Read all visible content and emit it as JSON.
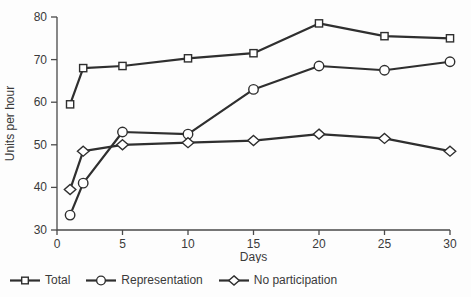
{
  "figure": {
    "background": "#fdfdfd"
  },
  "chart_data": {
    "type": "line",
    "title": "",
    "xlabel": "Days",
    "ylabel": "Units per hour",
    "xlim": [
      0,
      30
    ],
    "ylim": [
      30,
      80
    ],
    "x_ticks": [
      0,
      5,
      10,
      15,
      20,
      25,
      30
    ],
    "y_ticks": [
      30,
      40,
      50,
      60,
      70,
      80
    ],
    "grid": false,
    "legend_position": "bottom-left",
    "x": [
      1,
      2,
      5,
      10,
      15,
      20,
      25,
      30
    ],
    "series": [
      {
        "name": "Total",
        "marker": "square",
        "values": [
          59.5,
          68,
          68.5,
          70.3,
          71.5,
          78.5,
          75.5,
          75
        ]
      },
      {
        "name": "Representation",
        "marker": "circle",
        "values": [
          33.5,
          41,
          53,
          52.5,
          63,
          68.5,
          67.5,
          69.5
        ]
      },
      {
        "name": "No participation",
        "marker": "diamond",
        "values": [
          39.5,
          48.5,
          50,
          50.5,
          51,
          52.5,
          51.5,
          48.5
        ]
      }
    ],
    "line_color": "#2f2f2f",
    "marker_fill": "#ffffff",
    "axis_color": "#4a4a4a",
    "text_color": "#3a3a3a"
  }
}
